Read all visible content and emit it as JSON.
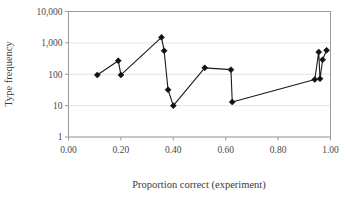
{
  "chart_data": {
    "type": "line",
    "title": "",
    "xlabel": "Proportion correct (experiment)",
    "ylabel": "Type frequency",
    "xlim": [
      0.0,
      1.0
    ],
    "ylim": [
      1,
      10000
    ],
    "yscale": "log",
    "grid": true,
    "legend": null,
    "xticks": [
      0.0,
      0.2,
      0.4,
      0.6,
      0.8,
      1.0
    ],
    "xtick_labels": [
      "0.00",
      "0.20",
      "0.40",
      "0.60",
      "0.80",
      "1.00"
    ],
    "yticks": [
      1,
      10,
      100,
      1000,
      10000
    ],
    "ytick_labels": [
      "1",
      "10",
      "100",
      "1,000",
      "10,000"
    ],
    "marker": "diamond",
    "marker_color": "#111111",
    "line_color": "#1a1a1a",
    "series": [
      {
        "name": "Type frequency",
        "x": [
          0.11,
          0.19,
          0.2,
          0.355,
          0.365,
          0.38,
          0.4,
          0.52,
          0.62,
          0.625,
          0.94,
          0.955,
          0.96,
          0.97,
          0.985
        ],
        "y": [
          95,
          270,
          95,
          1500,
          560,
          32,
          10,
          160,
          140,
          13,
          68,
          510,
          72,
          290,
          580
        ]
      }
    ]
  },
  "axes": {
    "x_title": "Proportion correct (experiment)",
    "y_title": "Type frequency"
  }
}
